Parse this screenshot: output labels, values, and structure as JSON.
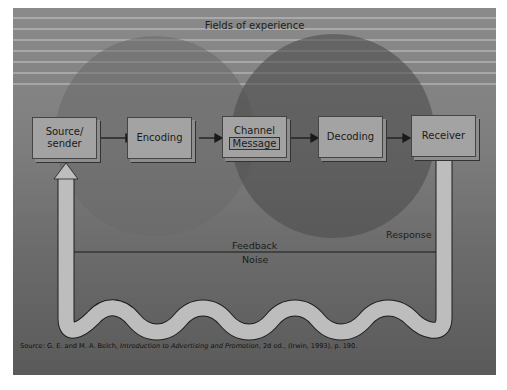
{
  "diagram": {
    "title": "Fields of experience",
    "nodes": [
      {
        "id": "source",
        "label_line1": "Source/",
        "label_line2": "sender"
      },
      {
        "id": "encoding",
        "label": "Encoding"
      },
      {
        "id": "channel",
        "label": "Channel",
        "sublabel": "Message"
      },
      {
        "id": "decoding",
        "label": "Decoding"
      },
      {
        "id": "receiver",
        "label": "Receiver"
      }
    ],
    "edges": [
      {
        "from": "source",
        "to": "encoding"
      },
      {
        "from": "encoding",
        "to": "channel"
      },
      {
        "from": "channel",
        "to": "decoding"
      },
      {
        "from": "decoding",
        "to": "receiver"
      },
      {
        "from": "receiver",
        "to": "source",
        "via": "feedback-loop"
      }
    ],
    "labels": {
      "response": "Response",
      "feedback": "Feedback",
      "noise": "Noise"
    },
    "caption": {
      "prefix": "Source: G. E. and M. A. Belch, ",
      "title": "Introduction to Advertising and Promotion",
      "suffix": ", 2d ed., (Irwin, 1993), p. 190."
    },
    "colors": {
      "background": "#7f7f7f",
      "sender_field": "#6e6e6e",
      "receiver_field": "#5c5c5c",
      "box_fill": "#a3a3a3",
      "loop_fill": "#bdbdbd"
    }
  }
}
